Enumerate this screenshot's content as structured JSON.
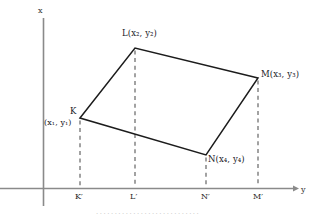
{
  "figure": {
    "title": "",
    "axes": {
      "vertical_label": "x",
      "horizontal_label": "y",
      "axis_color": "#8a8a8a"
    },
    "vertices": [
      {
        "id": "K",
        "label": "K",
        "coord_label": "(x₁, y₁)",
        "coord_on_separate_line": true,
        "x": 80,
        "y": 118
      },
      {
        "id": "L",
        "label": "L",
        "coord_label": "(x₂, y₂)",
        "coord_on_separate_line": false,
        "x": 135,
        "y": 48
      },
      {
        "id": "M",
        "label": "M",
        "coord_label": "(x₃, y₃)",
        "coord_on_separate_line": false,
        "x": 258,
        "y": 78
      },
      {
        "id": "N",
        "label": "N",
        "coord_label": "(x₄, y₄)",
        "coord_on_separate_line": false,
        "x": 206,
        "y": 155
      }
    ],
    "feet": [
      {
        "id": "Kp",
        "label": "K′",
        "x": 80
      },
      {
        "id": "Lp",
        "label": "L′",
        "x": 135
      },
      {
        "id": "Np",
        "label": "N′",
        "x": 206
      },
      {
        "id": "Mp",
        "label": "M′",
        "x": 258
      }
    ],
    "vertex_label_text": {
      "K_name": "K",
      "K_coords": "(x₁, y₁)",
      "L_full": "L(x₂, y₂)",
      "M_full": "M(x₃, y₃)",
      "N_full": "N(x₄, y₄)"
    },
    "colors": {
      "polygon_stroke": "#1c1c1c",
      "dashed_stroke": "#6b6b6b",
      "axis_stroke": "#8a8a8a",
      "background": "#ffffff"
    },
    "bottom_caption": "····························"
  },
  "chart_data": {
    "type": "scatter",
    "xlabel": "y",
    "ylabel": "x",
    "grid": false,
    "legend": "none",
    "annotations": [
      "K(x₁, y₁)",
      "L(x₂, y₂)",
      "M(x₃, y₃)",
      "N(x₄, y₄)",
      "K′",
      "L′",
      "N′",
      "M′"
    ],
    "series": [
      {
        "name": "KLMN",
        "points": [
          {
            "label": "K",
            "px": 80,
            "py": 118
          },
          {
            "label": "L",
            "px": 135,
            "py": 48
          },
          {
            "label": "M",
            "px": 258,
            "py": 78
          },
          {
            "label": "N",
            "px": 206,
            "py": 155
          }
        ]
      },
      {
        "name": "feet",
        "points": [
          {
            "label": "K′",
            "px": 80,
            "py": 188
          },
          {
            "label": "L′",
            "px": 135,
            "py": 188
          },
          {
            "label": "N′",
            "px": 206,
            "py": 188
          },
          {
            "label": "M′",
            "px": 258,
            "py": 188
          }
        ]
      }
    ]
  }
}
